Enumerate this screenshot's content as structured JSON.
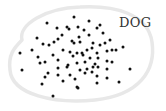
{
  "diagram": {
    "label": "DOG",
    "colors": {
      "background": "#ffffff",
      "blob_stroke": "#e8e8e8",
      "dot": "#111111",
      "label": "#333333"
    },
    "blob_path": "M 22 40 C 18 25, 45 8, 80 7 C 115 5, 148 14, 152 42 C 156 70, 140 95, 95 100 C 55 104, 12 95, 10 70 C 8 55, 14 48, 22 40 Z",
    "dot_radius": 1.5,
    "dots": [
      [
        74,
        17
      ],
      [
        47,
        23
      ],
      [
        89,
        21
      ],
      [
        57,
        28
      ],
      [
        67,
        27
      ],
      [
        69,
        29
      ],
      [
        78,
        27
      ],
      [
        84,
        30
      ],
      [
        100,
        25
      ],
      [
        97,
        28
      ],
      [
        103,
        33
      ],
      [
        62,
        35
      ],
      [
        37,
        38
      ],
      [
        58,
        39
      ],
      [
        54,
        42
      ],
      [
        43,
        44
      ],
      [
        49,
        45
      ],
      [
        72,
        41
      ],
      [
        79,
        37
      ],
      [
        89,
        35
      ],
      [
        80,
        42
      ],
      [
        74,
        43
      ],
      [
        93,
        43
      ],
      [
        100,
        45
      ],
      [
        105,
        43
      ],
      [
        110,
        40
      ],
      [
        123,
        47
      ],
      [
        20,
        53
      ],
      [
        32,
        50
      ],
      [
        63,
        50
      ],
      [
        70,
        52
      ],
      [
        77,
        53
      ],
      [
        82,
        53
      ],
      [
        87,
        50
      ],
      [
        92,
        48
      ],
      [
        97,
        53
      ],
      [
        107,
        51
      ],
      [
        112,
        50
      ],
      [
        116,
        50
      ],
      [
        38,
        57
      ],
      [
        53,
        55
      ],
      [
        73,
        56
      ],
      [
        83,
        55
      ],
      [
        90,
        58
      ],
      [
        98,
        58
      ],
      [
        40,
        63
      ],
      [
        45,
        62
      ],
      [
        58,
        60
      ],
      [
        68,
        65
      ],
      [
        77,
        63
      ],
      [
        85,
        62
      ],
      [
        95,
        64
      ],
      [
        107,
        61
      ],
      [
        112,
        62
      ],
      [
        22,
        70
      ],
      [
        58,
        68
      ],
      [
        67,
        67
      ],
      [
        80,
        70
      ],
      [
        87,
        69
      ],
      [
        93,
        67
      ],
      [
        98,
        67
      ],
      [
        107,
        69
      ],
      [
        130,
        69
      ],
      [
        48,
        73
      ],
      [
        45,
        77
      ],
      [
        58,
        75
      ],
      [
        70,
        75
      ],
      [
        75,
        79
      ],
      [
        85,
        73
      ],
      [
        92,
        72
      ],
      [
        97,
        76
      ],
      [
        63,
        81
      ],
      [
        107,
        78
      ],
      [
        42,
        84
      ],
      [
        77,
        87
      ],
      [
        78,
        88
      ],
      [
        97,
        83
      ],
      [
        119,
        82
      ],
      [
        53,
        96
      ]
    ]
  }
}
